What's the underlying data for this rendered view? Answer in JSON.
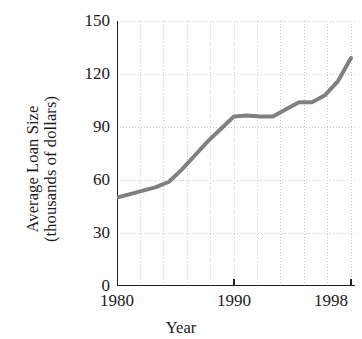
{
  "chart_data": {
    "type": "line",
    "title": "",
    "xlabel": "Year",
    "ylabel": "Average Loan Size (thousands of dollars)",
    "ylabel_line1": "Average Loan Size",
    "ylabel_line2": "(thousands of dollars)",
    "xlim": [
      1980,
      1998
    ],
    "ylim": [
      0,
      150
    ],
    "yticks": [
      0,
      30,
      60,
      90,
      120,
      150
    ],
    "ytick_labels": [
      "0",
      "30",
      "60",
      "90",
      "120",
      "150"
    ],
    "xticks": [
      1980,
      1990,
      1998
    ],
    "xtick_labels": [
      "1980",
      "1990",
      "1998"
    ],
    "grid": true,
    "grid_style": "dotted",
    "grid_x_step": 2,
    "legend": "none",
    "series": [
      {
        "name": "Average Loan Size",
        "color": "#808080",
        "line_width": 4,
        "x": [
          1980,
          1981,
          1982,
          1983,
          1984,
          1985,
          1986,
          1987,
          1988,
          1989,
          1990,
          1991,
          1992,
          1993,
          1994,
          1995,
          1996,
          1997,
          1998
        ],
        "values": [
          50,
          52,
          54,
          56,
          59,
          66,
          74,
          82,
          89,
          96,
          96.5,
          96,
          96,
          100,
          104,
          104,
          108,
          116,
          129
        ]
      }
    ]
  },
  "axes": {
    "y_tick_0": "0",
    "y_tick_30": "30",
    "y_tick_60": "60",
    "y_tick_90": "90",
    "y_tick_120": "120",
    "y_tick_150": "150",
    "x_tick_1980": "1980",
    "x_tick_1990": "1990",
    "x_tick_1998": "1998"
  }
}
